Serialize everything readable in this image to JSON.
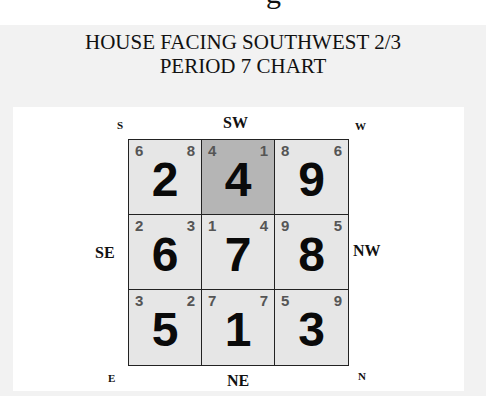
{
  "cutoff_text": "g",
  "title": {
    "line1": "HOUSE FACING SOUTHWEST 2/3",
    "line2": "PERIOD 7 CHART"
  },
  "directions": {
    "top": "SW",
    "bottom": "NE",
    "left": "SE",
    "right": "NW",
    "top_left": "S",
    "top_right": "W",
    "bottom_left": "E",
    "bottom_right": "N"
  },
  "colors": {
    "cell_fill": "#e6e6e6",
    "facing_cell_fill": "#b5b5b5",
    "grid_line": "#222222",
    "mini_number": "#555555"
  },
  "grid": {
    "cells": [
      {
        "sector": "S",
        "left": "6",
        "right": "8",
        "base": "2",
        "highlight": false
      },
      {
        "sector": "SW",
        "left": "4",
        "right": "1",
        "base": "4",
        "highlight": true
      },
      {
        "sector": "W",
        "left": "8",
        "right": "6",
        "base": "9",
        "highlight": false
      },
      {
        "sector": "SE",
        "left": "2",
        "right": "3",
        "base": "6",
        "highlight": false
      },
      {
        "sector": "Center",
        "left": "1",
        "right": "4",
        "base": "7",
        "highlight": false
      },
      {
        "sector": "NW",
        "left": "9",
        "right": "5",
        "base": "8",
        "highlight": false
      },
      {
        "sector": "E",
        "left": "3",
        "right": "2",
        "base": "5",
        "highlight": false
      },
      {
        "sector": "NE",
        "left": "7",
        "right": "7",
        "base": "1",
        "highlight": false
      },
      {
        "sector": "N",
        "left": "5",
        "right": "9",
        "base": "3",
        "highlight": false
      }
    ]
  }
}
